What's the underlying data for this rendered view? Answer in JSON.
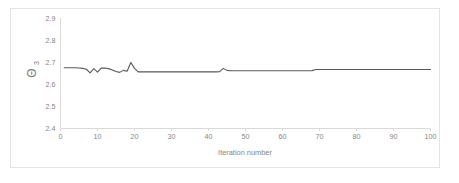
{
  "chart_data": {
    "type": "line",
    "title": "",
    "xlabel": "Iteration number",
    "ylabel": "Θ3",
    "ylabel_base": "Θ",
    "ylabel_subscript": "3",
    "xlim": [
      0,
      100
    ],
    "ylim": [
      2.4,
      2.9
    ],
    "xticks": [
      0,
      10,
      20,
      30,
      40,
      50,
      60,
      70,
      80,
      90,
      100
    ],
    "yticks": [
      2.4,
      2.5,
      2.6,
      2.7,
      2.8,
      2.9
    ],
    "xtick_labels": [
      "0",
      "10",
      "20",
      "30",
      "40",
      "50",
      "60",
      "70",
      "80",
      "90",
      "100"
    ],
    "ytick_labels": [
      "2.4",
      "2.5",
      "2.6",
      "2.7",
      "2.8",
      "2.9"
    ],
    "grid": false,
    "legend": false,
    "legend_position": "none",
    "line_color": "#595959",
    "axis_color": "#d9d9d9",
    "tick_label_color": "#868686",
    "background_color": "#ffffff",
    "border_color": "#e4e4e4",
    "series": [
      {
        "name": "theta_3",
        "x": [
          1,
          2,
          3,
          4,
          5,
          6,
          7,
          8,
          9,
          10,
          11,
          12,
          13,
          14,
          15,
          16,
          17,
          18,
          19,
          20,
          21,
          22,
          23,
          24,
          25,
          26,
          27,
          28,
          29,
          30,
          31,
          32,
          33,
          34,
          35,
          36,
          37,
          38,
          39,
          40,
          41,
          42,
          43,
          44,
          45,
          46,
          47,
          48,
          49,
          50,
          51,
          52,
          53,
          54,
          55,
          56,
          57,
          58,
          59,
          60,
          61,
          62,
          63,
          64,
          65,
          66,
          67,
          68,
          69,
          70,
          71,
          72,
          73,
          74,
          75,
          76,
          77,
          78,
          79,
          80,
          81,
          82,
          83,
          84,
          85,
          86,
          87,
          88,
          89,
          90,
          91,
          92,
          93,
          94,
          95,
          96,
          97,
          98,
          99,
          100
        ],
        "values": [
          2.675,
          2.675,
          2.675,
          2.675,
          2.674,
          2.672,
          2.668,
          2.652,
          2.671,
          2.655,
          2.673,
          2.674,
          2.671,
          2.665,
          2.658,
          2.654,
          2.663,
          2.659,
          2.699,
          2.672,
          2.656,
          2.656,
          2.656,
          2.656,
          2.656,
          2.656,
          2.656,
          2.656,
          2.656,
          2.656,
          2.656,
          2.656,
          2.656,
          2.656,
          2.656,
          2.656,
          2.656,
          2.656,
          2.656,
          2.656,
          2.656,
          2.656,
          2.657,
          2.672,
          2.663,
          2.661,
          2.661,
          2.661,
          2.661,
          2.661,
          2.661,
          2.661,
          2.661,
          2.661,
          2.661,
          2.661,
          2.661,
          2.661,
          2.661,
          2.661,
          2.661,
          2.661,
          2.661,
          2.661,
          2.661,
          2.661,
          2.661,
          2.662,
          2.667,
          2.667,
          2.667,
          2.667,
          2.667,
          2.667,
          2.667,
          2.667,
          2.667,
          2.667,
          2.667,
          2.667,
          2.667,
          2.667,
          2.667,
          2.667,
          2.667,
          2.667,
          2.667,
          2.667,
          2.667,
          2.667,
          2.667,
          2.667,
          2.667,
          2.667,
          2.667,
          2.667,
          2.667,
          2.667,
          2.667,
          2.667
        ]
      }
    ]
  }
}
